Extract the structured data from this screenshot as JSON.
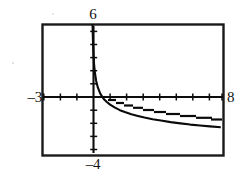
{
  "figure": {
    "kind": "graphing-calculator-window",
    "background_color": "#ffffff",
    "ink_color": "#000000"
  },
  "labels": {
    "y_max": "6",
    "y_min": "–4",
    "x_min": "–3",
    "x_max": "8"
  },
  "chart_data": {
    "type": "line",
    "title": "",
    "subtitle": "",
    "xlabel": "",
    "ylabel": "",
    "xlim": [
      -3,
      8
    ],
    "ylim": [
      -4,
      6
    ],
    "grid": false,
    "legend": null,
    "axes": {
      "x_axis_at_y": 0,
      "y_axis_at_x": 0,
      "x_tick_step": 1,
      "y_tick_step": 1,
      "x_ticks": [
        -3,
        -2,
        -1,
        0,
        1,
        2,
        3,
        4,
        5,
        6,
        7,
        8
      ],
      "y_ticks": [
        -4,
        -3,
        -2,
        -1,
        0,
        1,
        2,
        3,
        4,
        5,
        6
      ],
      "tick_labels_shown": [
        "6",
        "–4",
        "–3",
        "8"
      ],
      "frame_visible": true
    },
    "annotations": [
      {
        "text": "6",
        "position": "top-center",
        "meaning": "y-axis maximum"
      },
      {
        "text": "–4",
        "position": "bottom-center",
        "meaning": "y-axis minimum"
      },
      {
        "text": "–3",
        "position": "left-middle",
        "meaning": "x-axis minimum"
      },
      {
        "text": "8",
        "position": "right-middle",
        "meaning": "x-axis maximum"
      }
    ],
    "series": [
      {
        "name": "curve",
        "description": "decreasing curve with vertical asymptote at x = 0, falling steeply then flattening toward a horizontal tail below the x-axis",
        "x": [
          0.03,
          0.05,
          0.08,
          0.12,
          0.18,
          0.25,
          0.35,
          0.5,
          0.7,
          0.9,
          1.1,
          1.4,
          1.7,
          2.0,
          2.4,
          2.8,
          3.2,
          3.7,
          4.2,
          4.8,
          5.4,
          6.0,
          6.6,
          7.2,
          7.8
        ],
        "y": [
          6.0,
          4.9,
          3.9,
          3.0,
          2.25,
          1.7,
          1.2,
          0.72,
          0.33,
          0.08,
          -0.12,
          -0.36,
          -0.55,
          -0.7,
          -0.87,
          -1.0,
          -1.12,
          -1.25,
          -1.35,
          -1.47,
          -1.57,
          -1.66,
          -1.73,
          -1.8,
          -1.86
        ]
      }
    ]
  }
}
